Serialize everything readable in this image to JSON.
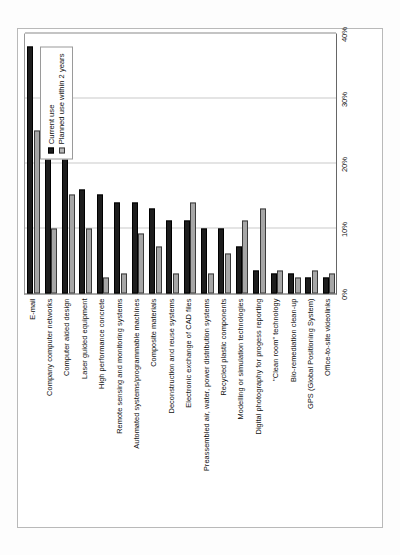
{
  "chart_data": {
    "type": "bar",
    "orientation": "horizontal",
    "title": "",
    "subtitle": "",
    "xlabel": "",
    "ylabel": "",
    "xlim": [
      0,
      40
    ],
    "grid": true,
    "grid_axis": "x",
    "legend_position": "right",
    "tick_labels": [
      "0%",
      "10%",
      "20%",
      "30%",
      "40%"
    ],
    "tick_values": [
      0,
      10,
      20,
      30,
      40
    ],
    "categories": [
      "E-mail",
      "Company computer networks",
      "Computer aided design",
      "Laser guided equipment",
      "High performance concrete",
      "Remote sensing and monitoring systems",
      "Automated systems/programmable machines",
      "Composite materials",
      "Deconstruction and reuse systems",
      "Electronic exchange of CAD files",
      "Preassembled air, water, power distribution systems",
      "Recycled plastic components",
      "Modelling or simulation technologies",
      "Digital photography for progess reporting",
      "\"Clean room\" technology",
      "Bio-remediation clean-up",
      "GPS (Global Positioning System)",
      "Office-to-site videolinks"
    ],
    "series": [
      {
        "name": "Current use",
        "color": "#1d1d1d",
        "values": [
          38.0,
          25.0,
          23.0,
          16.0,
          15.2,
          14.0,
          14.0,
          13.0,
          11.2,
          11.2,
          10.0,
          10.0,
          7.2,
          3.6,
          3.0,
          3.0,
          2.4,
          2.4
        ]
      },
      {
        "name": "Planned use within 2 years",
        "color": "#b8b8b8",
        "values": [
          25.0,
          10.0,
          15.2,
          10.0,
          2.4,
          3.0,
          9.2,
          7.2,
          3.0,
          14.0,
          3.0,
          6.2,
          11.2,
          13.0,
          3.6,
          2.4,
          3.6,
          3.0
        ]
      }
    ]
  },
  "legend": {
    "entries": [
      {
        "label": "Current use"
      },
      {
        "label": "Planned use within 2 years"
      }
    ]
  }
}
